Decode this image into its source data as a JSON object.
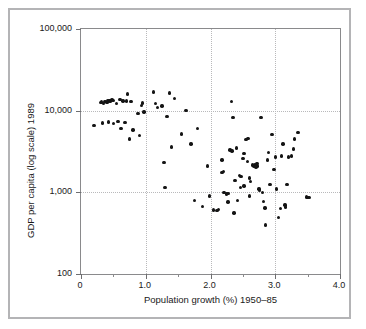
{
  "figure": {
    "background_color": "#ffffff",
    "frame_color": "#b4b4b6",
    "axis_color": "#8a8a8c",
    "grid_color": "#b9b9bb",
    "marker_color": "#141414"
  },
  "chart_data": {
    "type": "scatter",
    "title": "",
    "xlabel": "Population growth (%) 1950–85",
    "ylabel": "GDP per capita (log scale) 1989",
    "xlim": [
      0,
      4.0
    ],
    "ylim": [
      100,
      100000
    ],
    "yscale": "log",
    "xscale": "linear",
    "grid": true,
    "legend": null,
    "xticks": [
      0,
      1.0,
      2.0,
      3.0,
      4.0
    ],
    "xticklabels": [
      "0",
      "1.0",
      "2.0",
      "3.0",
      "4.0"
    ],
    "xticks_minor": [
      0.5,
      1.5,
      2.5,
      3.5
    ],
    "yticks": [
      100,
      1000,
      10000,
      100000
    ],
    "yticklabels": [
      "100",
      "1,000",
      "10,000",
      "100,000"
    ],
    "gridlines_y": [
      1000,
      10000
    ],
    "gridlines_x": [
      1.0,
      2.0,
      3.0
    ],
    "series": [
      {
        "name": "Countries",
        "marker": "circle",
        "color": "#141414",
        "points": [
          [
            0.2,
            6600
          ],
          [
            0.3,
            12500
          ],
          [
            0.32,
            12800
          ],
          [
            0.35,
            12300
          ],
          [
            0.37,
            13000
          ],
          [
            0.4,
            12600
          ],
          [
            0.41,
            13300
          ],
          [
            0.43,
            13200
          ],
          [
            0.45,
            13400
          ],
          [
            0.46,
            13000
          ],
          [
            0.48,
            13500
          ],
          [
            0.5,
            13300
          ],
          [
            0.33,
            7100
          ],
          [
            0.42,
            7300
          ],
          [
            0.5,
            7000
          ],
          [
            0.55,
            12300
          ],
          [
            0.57,
            7400
          ],
          [
            0.6,
            13600
          ],
          [
            0.62,
            6100
          ],
          [
            0.65,
            13200
          ],
          [
            0.68,
            7200
          ],
          [
            0.7,
            13100
          ],
          [
            0.72,
            16000
          ],
          [
            0.75,
            4500
          ],
          [
            0.77,
            12900
          ],
          [
            0.8,
            5800
          ],
          [
            0.88,
            9300
          ],
          [
            0.9,
            5000
          ],
          [
            0.93,
            11500
          ],
          [
            0.95,
            12400
          ],
          [
            0.97,
            9600
          ],
          [
            1.12,
            17000
          ],
          [
            1.15,
            12300
          ],
          [
            1.18,
            11000
          ],
          [
            1.25,
            11400
          ],
          [
            1.28,
            2300
          ],
          [
            1.3,
            1150
          ],
          [
            1.33,
            8500
          ],
          [
            1.37,
            16500
          ],
          [
            1.4,
            3600
          ],
          [
            1.44,
            14000
          ],
          [
            1.55,
            5200
          ],
          [
            1.62,
            10000
          ],
          [
            1.7,
            3900
          ],
          [
            1.75,
            800
          ],
          [
            1.8,
            6000
          ],
          [
            1.88,
            670
          ],
          [
            1.95,
            2100
          ],
          [
            1.98,
            900
          ],
          [
            2.05,
            610
          ],
          [
            2.1,
            600
          ],
          [
            2.12,
            620
          ],
          [
            2.18,
            2500
          ],
          [
            2.2,
            1800
          ],
          [
            2.22,
            1000
          ],
          [
            2.25,
            950
          ],
          [
            2.27,
            960
          ],
          [
            2.3,
            3300
          ],
          [
            2.32,
            13000
          ],
          [
            2.33,
            3200
          ],
          [
            2.35,
            8200
          ],
          [
            2.36,
            560
          ],
          [
            2.38,
            1400
          ],
          [
            2.4,
            3500
          ],
          [
            2.42,
            800
          ],
          [
            2.45,
            1600
          ],
          [
            2.47,
            1550
          ],
          [
            2.5,
            2600
          ],
          [
            2.52,
            3000
          ],
          [
            2.55,
            4400
          ],
          [
            2.57,
            2400
          ],
          [
            2.58,
            4600
          ],
          [
            2.6,
            1500
          ],
          [
            2.62,
            1350
          ],
          [
            2.65,
            2150
          ],
          [
            2.67,
            2100
          ],
          [
            2.68,
            2200
          ],
          [
            2.7,
            2050
          ],
          [
            2.71,
            2150
          ],
          [
            2.72,
            2250
          ],
          [
            2.73,
            2100
          ],
          [
            2.75,
            1100
          ],
          [
            2.76,
            1050
          ],
          [
            2.78,
            8300
          ],
          [
            2.8,
            1000
          ],
          [
            2.82,
            770
          ],
          [
            2.84,
            640
          ],
          [
            2.85,
            400
          ],
          [
            2.88,
            2500
          ],
          [
            2.9,
            3100
          ],
          [
            2.92,
            1250
          ],
          [
            2.95,
            5100
          ],
          [
            2.98,
            1900
          ],
          [
            3.0,
            2700
          ],
          [
            3.02,
            1100
          ],
          [
            3.05,
            490
          ],
          [
            3.08,
            630
          ],
          [
            3.1,
            2800
          ],
          [
            3.12,
            3900
          ],
          [
            3.15,
            700
          ],
          [
            3.16,
            660
          ],
          [
            3.18,
            1250
          ],
          [
            3.2,
            2700
          ],
          [
            3.25,
            2800
          ],
          [
            3.28,
            3400
          ],
          [
            3.3,
            4500
          ],
          [
            3.35,
            5400
          ],
          [
            3.48,
            880
          ],
          [
            3.5,
            860
          ],
          [
            3.52,
            870
          ],
          [
            2.18,
            1750
          ],
          [
            2.52,
            1200
          ],
          [
            2.46,
            1150
          ],
          [
            2.27,
            760
          ],
          [
            2.6,
            900
          ],
          [
            2.2,
            990
          ]
        ]
      }
    ]
  }
}
